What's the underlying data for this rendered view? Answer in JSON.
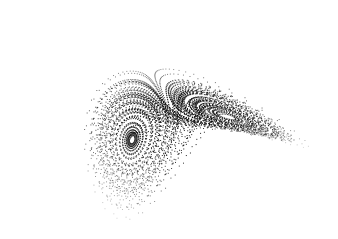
{
  "figure": {
    "background": "#ffffff",
    "dot_color": "#000000",
    "width": 338,
    "height": 239
  },
  "lorenz": {
    "sigma": 10,
    "rho": 28,
    "beta": 2.6666667,
    "dt": 0.006,
    "steps": 16000,
    "skip": 200,
    "sample_every": 3,
    "start": [
      0.1,
      0.0,
      20.0
    ]
  },
  "projection": {
    "center_x": 176,
    "center_y": 122,
    "scale": 5.6,
    "rotation_deg": -28,
    "squash": 0.55
  }
}
